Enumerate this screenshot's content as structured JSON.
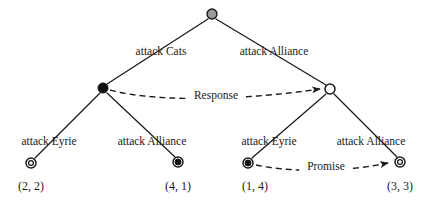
{
  "figure": {
    "type": "game-tree",
    "width": 430,
    "height": 204,
    "background": "#ffffff",
    "line_color": "#1a1a1a",
    "text_color": "#1a1a1a"
  },
  "nodes": {
    "root": {
      "id": "root",
      "style": "gray-circle",
      "fill": "#9a9a9a",
      "stroke": "#1a1a1a",
      "x": 212,
      "y": 14,
      "r": 5
    },
    "left_decision": {
      "id": "left-decision",
      "style": "filled-circle",
      "fill": "#111111",
      "stroke": "#111111",
      "x": 103,
      "y": 88,
      "r": 5
    },
    "right_decision": {
      "id": "right-decision",
      "style": "hollow-circle",
      "fill": "#ffffff",
      "stroke": "#1a1a1a",
      "x": 330,
      "y": 89,
      "r": 5
    },
    "terminal_22": {
      "id": "terminal-2-2",
      "style": "double-ring-hollow",
      "fill": "#ffffff",
      "stroke": "#1a1a1a",
      "x": 31,
      "y": 163,
      "r": 5
    },
    "terminal_41": {
      "id": "terminal-4-1",
      "style": "double-ring-filled",
      "fill": "#111111",
      "stroke": "#1a1a1a",
      "x": 178,
      "y": 162,
      "r": 5
    },
    "terminal_14": {
      "id": "terminal-1-4",
      "style": "double-ring-filled",
      "fill": "#111111",
      "stroke": "#1a1a1a",
      "x": 248,
      "y": 163,
      "r": 5
    },
    "terminal_33": {
      "id": "terminal-3-3",
      "style": "double-ring-hollow",
      "fill": "#ffffff",
      "stroke": "#1a1a1a",
      "x": 400,
      "y": 162,
      "r": 5
    }
  },
  "edges": [
    {
      "name": "root-to-left",
      "from": "root",
      "to": "left_decision",
      "x1": 208,
      "y1": 19,
      "x2": 107,
      "y2": 84
    },
    {
      "name": "root-to-right",
      "from": "root",
      "to": "right_decision",
      "x1": 216,
      "y1": 19,
      "x2": 326,
      "y2": 85
    },
    {
      "name": "left-to-terminal-22",
      "from": "left_decision",
      "to": "terminal_22",
      "x1": 100,
      "y1": 93,
      "x2": 35,
      "y2": 158
    },
    {
      "name": "left-to-terminal-41",
      "from": "left_decision",
      "to": "terminal_41",
      "x1": 107,
      "y1": 93,
      "x2": 175,
      "y2": 157
    },
    {
      "name": "right-to-terminal-14",
      "from": "right_decision",
      "to": "terminal_14",
      "x1": 326,
      "y1": 94,
      "x2": 252,
      "y2": 158
    },
    {
      "name": "right-to-terminal-33",
      "from": "right_decision",
      "to": "terminal_33",
      "x1": 334,
      "y1": 94,
      "x2": 397,
      "y2": 157
    }
  ],
  "action_labels": [
    {
      "name": "action-attack-cats",
      "text": "attack Cats",
      "x": 161,
      "y": 52
    },
    {
      "name": "action-attack-alliance-top",
      "text": "attack Alliance",
      "x": 274,
      "y": 52
    },
    {
      "name": "action-attack-eyrie-left",
      "text": "attack Eyrie",
      "x": 49,
      "y": 142
    },
    {
      "name": "action-attack-alliance-left",
      "text": "attack Alliance",
      "x": 152,
      "y": 142
    },
    {
      "name": "action-attack-eyrie-right",
      "text": "attack Eyrie",
      "x": 269,
      "y": 142
    },
    {
      "name": "action-attack-alliance-right",
      "text": "attack Alliance",
      "x": 371,
      "y": 142
    }
  ],
  "payoff_labels": [
    {
      "name": "payoff-2-2",
      "text": "(2, 2)",
      "x": 31,
      "y": 186,
      "values": [
        2,
        2
      ]
    },
    {
      "name": "payoff-4-1",
      "text": "(4, 1)",
      "x": 178,
      "y": 186,
      "values": [
        4,
        1
      ]
    },
    {
      "name": "payoff-1-4",
      "text": "(1, 4)",
      "x": 255,
      "y": 186,
      "values": [
        1,
        4
      ]
    },
    {
      "name": "payoff-3-3",
      "text": "(3, 3)",
      "x": 400,
      "y": 186,
      "values": [
        3,
        3
      ]
    }
  ],
  "message_arrows": [
    {
      "name": "response-arrow",
      "label": "Response",
      "label_x": 216,
      "label_y": 96,
      "from": "left_decision",
      "to": "right_decision",
      "path": "M 110 90 C 150 101, 230 102, 320 89",
      "dash": "6 4"
    },
    {
      "name": "promise-arrow",
      "label": "Promise",
      "label_x": 326,
      "label_y": 167,
      "from": "terminal_14",
      "to": "terminal_33",
      "path": "M 256 165 C 290 172, 340 173, 388 163",
      "dash": "6 4"
    }
  ]
}
